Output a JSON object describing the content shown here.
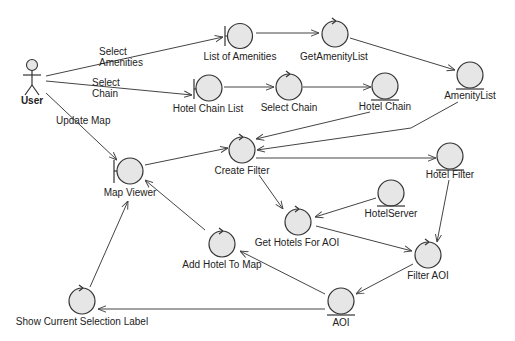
{
  "diagram": {
    "type": "UML robustness diagram",
    "actor": {
      "label": "User"
    },
    "nodes": [
      {
        "id": "list_of_amenities",
        "label": "List of Amenities",
        "kind": "boundary"
      },
      {
        "id": "get_amenity_list",
        "label": "GetAmenityList",
        "kind": "control"
      },
      {
        "id": "amenity_list",
        "label": "AmenityList",
        "kind": "entity"
      },
      {
        "id": "hotel_chain_list",
        "label": "Hotel Chain List",
        "kind": "boundary"
      },
      {
        "id": "select_chain",
        "label": "Select Chain",
        "kind": "control"
      },
      {
        "id": "hotel_chain",
        "label": "Hotel Chain",
        "kind": "entity"
      },
      {
        "id": "map_viewer",
        "label": "Map Viewer",
        "kind": "boundary"
      },
      {
        "id": "create_filter",
        "label": "Create Filter",
        "kind": "control"
      },
      {
        "id": "hotel_filter",
        "label": "Hotel Filter",
        "kind": "entity"
      },
      {
        "id": "hotel_server",
        "label": "HotelServer",
        "kind": "entity"
      },
      {
        "id": "get_hotels_for_aoi",
        "label": "Get Hotels For AOI",
        "kind": "control"
      },
      {
        "id": "add_hotel_to_map",
        "label": "Add Hotel To Map",
        "kind": "control"
      },
      {
        "id": "filter_aoi",
        "label": "Filter AOI",
        "kind": "control"
      },
      {
        "id": "aoi",
        "label": "AOI",
        "kind": "entity"
      },
      {
        "id": "show_current_selection_label",
        "label": "Show Current Selection Label",
        "kind": "control"
      }
    ],
    "edge_labels": {
      "select_amenities_1": "Select",
      "select_amenities_2": "Amenities",
      "select_chain_1": "Select",
      "select_chain_2": "Chain",
      "update_map": "Update Map"
    },
    "edges": [
      {
        "from": "User",
        "to": "List of Amenities",
        "label": "Select Amenities"
      },
      {
        "from": "User",
        "to": "Hotel Chain List",
        "label": "Select Chain"
      },
      {
        "from": "User",
        "to": "Map Viewer",
        "label": "Update Map"
      },
      {
        "from": "List of Amenities",
        "to": "GetAmenityList"
      },
      {
        "from": "GetAmenityList",
        "to": "AmenityList"
      },
      {
        "from": "Hotel Chain List",
        "to": "Select Chain"
      },
      {
        "from": "Select Chain",
        "to": "Hotel Chain"
      },
      {
        "from": "Hotel Chain",
        "to": "Create Filter"
      },
      {
        "from": "AmenityList",
        "to": "Create Filter"
      },
      {
        "from": "Map Viewer",
        "to": "Create Filter"
      },
      {
        "from": "Create Filter",
        "to": "Hotel Filter"
      },
      {
        "from": "Create Filter",
        "to": "Get Hotels For AOI"
      },
      {
        "from": "HotelServer",
        "to": "Get Hotels For AOI"
      },
      {
        "from": "Get Hotels For AOI",
        "to": "Filter AOI"
      },
      {
        "from": "Hotel Filter",
        "to": "Filter AOI"
      },
      {
        "from": "Filter AOI",
        "to": "AOI"
      },
      {
        "from": "AOI",
        "to": "Add Hotel To Map"
      },
      {
        "from": "Add Hotel To Map",
        "to": "Map Viewer"
      },
      {
        "from": "AOI",
        "to": "Show Current Selection Label"
      },
      {
        "from": "Show Current Selection Label",
        "to": "Map Viewer"
      }
    ]
  }
}
